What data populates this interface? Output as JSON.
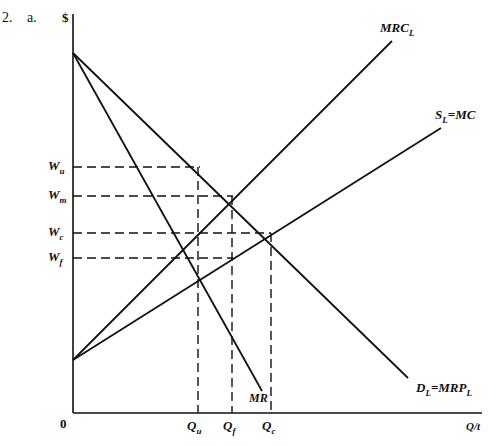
{
  "problem": {
    "number": "2.",
    "part": "a."
  },
  "axes": {
    "y_label": "$",
    "x_label": "Q/t",
    "origin": "0"
  },
  "curves": {
    "mrc": {
      "label": "MRC",
      "sub": "L"
    },
    "supply": {
      "label": "S",
      "sub": "L",
      "rest": "=MC"
    },
    "demand": {
      "label": "D",
      "sub": "L",
      "rest": "=MRP",
      "sub2": "L"
    },
    "mr": {
      "label": "MR"
    }
  },
  "wage_levels": [
    {
      "label": "W",
      "sub": "u"
    },
    {
      "label": "W",
      "sub": "m"
    },
    {
      "label": "W",
      "sub": "c"
    },
    {
      "label": "W",
      "sub": "f"
    }
  ],
  "quantity_levels": [
    {
      "label": "Q",
      "sub": "u"
    },
    {
      "label": "Q",
      "sub": "f"
    },
    {
      "label": "Q",
      "sub": "c"
    }
  ],
  "colors": {
    "line": "#111111",
    "background": "#ffffff"
  }
}
